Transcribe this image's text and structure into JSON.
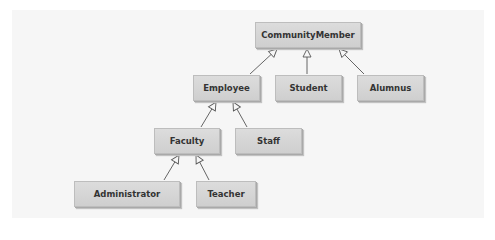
{
  "diagram": {
    "type": "UML class inheritance hierarchy",
    "nodes": [
      {
        "id": "communitymember",
        "label": "CommunityMember"
      },
      {
        "id": "employee",
        "label": "Employee"
      },
      {
        "id": "student",
        "label": "Student"
      },
      {
        "id": "alumnus",
        "label": "Alumnus"
      },
      {
        "id": "faculty",
        "label": "Faculty"
      },
      {
        "id": "staff",
        "label": "Staff"
      },
      {
        "id": "administrator",
        "label": "Administrator"
      },
      {
        "id": "teacher",
        "label": "Teacher"
      }
    ],
    "edges": [
      {
        "from": "Employee",
        "to": "CommunityMember",
        "kind": "inheritance"
      },
      {
        "from": "Student",
        "to": "CommunityMember",
        "kind": "inheritance"
      },
      {
        "from": "Alumnus",
        "to": "CommunityMember",
        "kind": "inheritance"
      },
      {
        "from": "Faculty",
        "to": "Employee",
        "kind": "inheritance"
      },
      {
        "from": "Staff",
        "to": "Employee",
        "kind": "inheritance"
      },
      {
        "from": "Administrator",
        "to": "Faculty",
        "kind": "inheritance"
      },
      {
        "from": "Teacher",
        "to": "Faculty",
        "kind": "inheritance"
      }
    ],
    "colors": {
      "box_fill": "#d4d4d4",
      "box_border": "#bdbdbd",
      "text": "#333333",
      "line": "#555555",
      "background": "#f6f6f6"
    }
  }
}
